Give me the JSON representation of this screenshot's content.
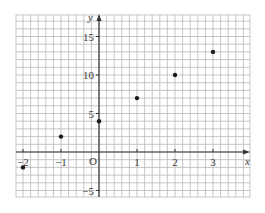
{
  "chart_data": {
    "type": "scatter",
    "title": "",
    "xlabel": "x",
    "ylabel": "y",
    "origin_label": "O",
    "xlim": [
      -2.2,
      3.95
    ],
    "ylim": [
      -5.8,
      17.8
    ],
    "x_ticks": [
      -2,
      -1,
      1,
      2,
      3
    ],
    "x_tick_labels": [
      "-2",
      "-1",
      "1",
      "2",
      "3"
    ],
    "y_ticks": [
      15,
      10,
      5,
      -5
    ],
    "y_tick_labels": [
      "15",
      "10",
      "5",
      "-5"
    ],
    "grid": true,
    "grid_minor_x_per_unit": 5,
    "grid_minor_y_per_unit": 1,
    "legend": null,
    "series": [
      {
        "name": "points",
        "x": [
          -2,
          -1,
          0,
          1,
          2,
          3
        ],
        "y": [
          -2,
          2,
          4,
          7,
          10,
          13
        ]
      }
    ]
  },
  "colors": {
    "grid": "#b8b8b8",
    "axis": "#333333",
    "point": "#1a1a1a",
    "label": "#3a3a3a",
    "background": "#ffffff"
  }
}
